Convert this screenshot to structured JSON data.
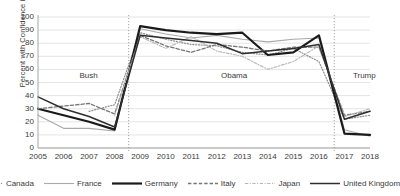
{
  "chart_data": {
    "type": "line",
    "title": "",
    "xlabel": "",
    "ylabel": "Percent with Confidence in President",
    "x": [
      2005,
      2006,
      2007,
      2008,
      2009,
      2010,
      2011,
      2012,
      2013,
      2014,
      2015,
      2016,
      2017,
      2018
    ],
    "xlim": [
      2005,
      2018
    ],
    "ylim": [
      0,
      100
    ],
    "yticks": [
      0,
      10,
      20,
      30,
      40,
      50,
      60,
      70,
      80,
      90,
      100
    ],
    "xticks": [
      "2005",
      "2006",
      "2007",
      "2008",
      "2009",
      "2010",
      "2011",
      "2012",
      "2013",
      "2014",
      "2015",
      "2016",
      "2017",
      "2018"
    ],
    "grid": "horizontal",
    "legend_position": "bottom",
    "series": [
      {
        "name": "Canada",
        "style": "dotted",
        "color": "#8c8c8c",
        "width": 1.2,
        "values": [
          null,
          null,
          28,
          33,
          88,
          83,
          79,
          78,
          73,
          71,
          76,
          66,
          22,
          25
        ]
      },
      {
        "name": "France",
        "style": "solid",
        "color": "#aaaaaa",
        "width": 1.1,
        "values": [
          25,
          15,
          15,
          13,
          91,
          87,
          84,
          86,
          83,
          81,
          83,
          84,
          14,
          9
        ]
      },
      {
        "name": "Germany",
        "style": "solid",
        "color": "#1a1a1a",
        "width": 2.2,
        "values": [
          30,
          25,
          20,
          14,
          93,
          90,
          88,
          87,
          88,
          71,
          73,
          86,
          11,
          10
        ]
      },
      {
        "name": "Italy",
        "style": "dashed",
        "color": "#767676",
        "width": 1.3,
        "values": [
          30,
          32,
          34,
          26,
          86,
          78,
          73,
          79,
          77,
          74,
          77,
          77,
          25,
          28
        ]
      },
      {
        "name": "Japan",
        "style": "dash-dot",
        "color": "#b5b5b5",
        "width": 1.1,
        "values": [
          null,
          null,
          null,
          25,
          85,
          76,
          85,
          74,
          70,
          60,
          66,
          78,
          24,
          30
        ]
      },
      {
        "name": "United Kingdom",
        "style": "solid",
        "color": "#2e2e2e",
        "width": 1.5,
        "values": [
          39,
          30,
          24,
          16,
          86,
          84,
          82,
          80,
          72,
          74,
          76,
          79,
          22,
          28
        ]
      }
    ],
    "annotations": [
      {
        "text": "Bush",
        "x": 2006.9,
        "y": 55
      },
      {
        "text": "Obama",
        "x": 2012.6,
        "y": 55
      },
      {
        "text": "Trump",
        "x": 2017.7,
        "y": 55
      }
    ],
    "dividers": [
      {
        "x": 2008.55,
        "style": "dotted"
      },
      {
        "x": 2016.6,
        "style": "dotted"
      }
    ]
  }
}
